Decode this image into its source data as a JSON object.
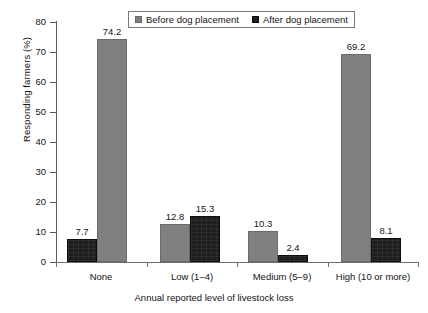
{
  "chart_data": {
    "type": "bar",
    "title": "",
    "xlabel": "Annual reported level of livestock loss",
    "ylabel": "Responding farmers (%)",
    "categories": [
      "None",
      "Low (1–4)",
      "Medium (5–9)",
      "High (10 or more)"
    ],
    "series": [
      {
        "name": "Before dog placement",
        "color": "#808080",
        "values": [
          74.2,
          12.8,
          10.3,
          69.2
        ]
      },
      {
        "name": "After dog placement",
        "color": "#1e1e1e",
        "values": [
          7.7,
          15.3,
          2.4,
          8.1
        ]
      }
    ],
    "ylim": [
      0,
      80
    ],
    "yticks": [
      0,
      10,
      20,
      30,
      40,
      50,
      60,
      70,
      80
    ],
    "ytick_labels": [
      "0",
      "10",
      "20",
      "30",
      "40",
      "50",
      "60",
      "70",
      "80"
    ],
    "grid": false,
    "legend_position": "top-center",
    "bar_order_note": "In the 'None' group the 'After dog placement' bar is drawn first (left of) the 'Before dog placement' bar; all other groups draw 'Before' first.",
    "data_labels": [
      "7.7",
      "74.2",
      "12.8",
      "15.3",
      "10.3",
      "2.4",
      "69.2",
      "8.1"
    ]
  },
  "legend": {
    "items": [
      {
        "label": "Before dog placement",
        "swatch": "legend-swatch-before"
      },
      {
        "label": "After dog placement",
        "swatch": "legend-swatch-after"
      }
    ]
  },
  "axes": {
    "y_title": "Responding farmers (%)",
    "x_title": "Annual reported level of livestock loss",
    "y_ticks": [
      "80",
      "70",
      "60",
      "50",
      "40",
      "30",
      "20",
      "10",
      "0"
    ],
    "x_categories": [
      "None",
      "Low (1–4)",
      "Medium (5–9)",
      "High (10 or more)"
    ]
  },
  "bars": [
    {
      "group": "None",
      "series": "After dog placement",
      "value": "7.7"
    },
    {
      "group": "None",
      "series": "Before dog placement",
      "value": "74.2"
    },
    {
      "group": "Low (1–4)",
      "series": "Before dog placement",
      "value": "12.8"
    },
    {
      "group": "Low (1–4)",
      "series": "After dog placement",
      "value": "15.3"
    },
    {
      "group": "Medium (5–9)",
      "series": "Before dog placement",
      "value": "10.3"
    },
    {
      "group": "Medium (5–9)",
      "series": "After dog placement",
      "value": "2.4"
    },
    {
      "group": "High (10 or more)",
      "series": "Before dog placement",
      "value": "69.2"
    },
    {
      "group": "High (10 or more)",
      "series": "After dog placement",
      "value": "8.1"
    }
  ]
}
